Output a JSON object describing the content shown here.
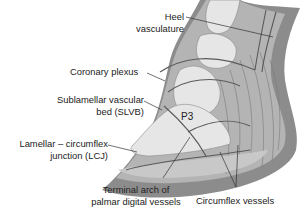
{
  "diagram": {
    "colors": {
      "background": "#ffffff",
      "hoof_wall": "#8c8c8c",
      "dermis": "#b4b4b4",
      "bone": "#e6e6e6",
      "vessels": "#5a5a5a",
      "label_text": "#222222",
      "leader_line": "#333333"
    },
    "labels": {
      "heel_vasculature": [
        "Heel",
        "vasculature"
      ],
      "coronary_plexus": "Coronary plexus",
      "slvb": [
        "Sublamellar vascular",
        "bed (SLVB)"
      ],
      "lcj": [
        "Lamellar – circumflex",
        "junction (LCJ)"
      ],
      "p3": "P3",
      "terminal_arch": [
        "Terminal arch of",
        "palmar digital vessels"
      ],
      "circumflex_vessels": "Circumflex vessels"
    }
  }
}
